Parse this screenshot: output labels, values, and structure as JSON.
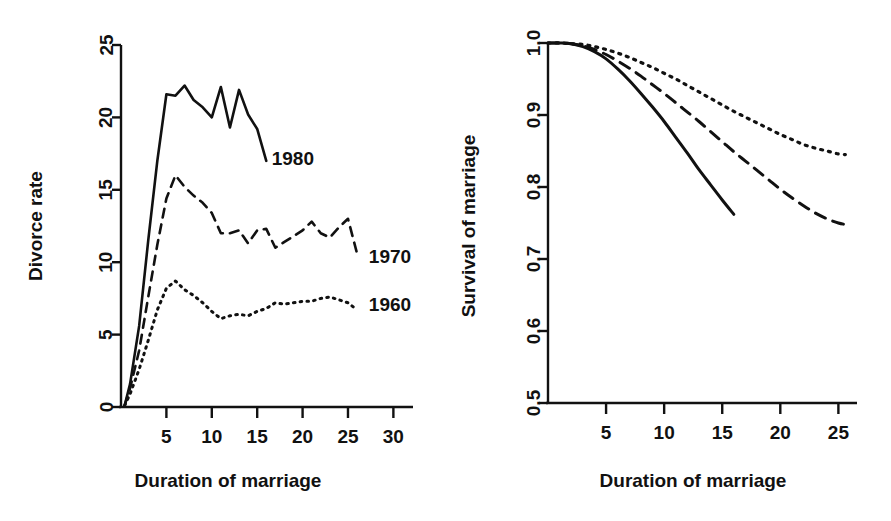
{
  "figure": {
    "background": "#ffffff",
    "ink": "#111111",
    "panels": [
      "divorce-rate",
      "survival-of-marriage"
    ]
  },
  "chart_data": [
    {
      "type": "line",
      "id": "divorce-rate",
      "title": "",
      "xlabel": "Duration of marriage",
      "ylabel": "Divorce rate",
      "xlim": [
        0,
        31.5
      ],
      "ylim": [
        0,
        25
      ],
      "xticks": [
        5,
        10,
        15,
        20,
        25,
        30
      ],
      "xticklabels": [
        "5",
        "10",
        "15",
        "20",
        "25",
        "30"
      ],
      "yticks": [
        0,
        5,
        10,
        15,
        20,
        25
      ],
      "yticklabels": [
        "0",
        "5",
        "10",
        "15",
        "20",
        "25"
      ],
      "grid": false,
      "legend": "inline-end-labels",
      "series": [
        {
          "name": "1980",
          "style": "solid",
          "label_x": 16.6,
          "label_y": 17.2,
          "x": [
            0.4,
            1,
            2,
            3,
            4,
            5,
            6,
            7,
            8,
            9,
            10,
            11,
            12,
            13,
            14,
            15,
            16
          ],
          "y": [
            0.1,
            1.6,
            5.6,
            11.5,
            17.0,
            21.6,
            21.5,
            22.2,
            21.2,
            20.7,
            20.0,
            22.1,
            19.3,
            21.9,
            20.2,
            19.2,
            17.0
          ]
        },
        {
          "name": "1970",
          "style": "dashed",
          "label_x": 27.3,
          "label_y": 10.4,
          "x": [
            0.4,
            1,
            2,
            3,
            4,
            5,
            6,
            7,
            8,
            9,
            10,
            11,
            12,
            13,
            14,
            15,
            16,
            17,
            18,
            19,
            20,
            21,
            22,
            23,
            24,
            25,
            26
          ],
          "y": [
            0.1,
            1.3,
            3.9,
            7.6,
            11.2,
            14.4,
            16.0,
            15.2,
            14.6,
            14.1,
            13.4,
            12.0,
            12.0,
            12.2,
            11.3,
            12.2,
            12.3,
            11.0,
            11.4,
            11.8,
            12.2,
            12.8,
            12.0,
            11.7,
            12.4,
            13.0,
            10.6
          ]
        },
        {
          "name": "1960",
          "style": "dotted",
          "label_x": 27.3,
          "label_y": 7.1,
          "x": [
            0.4,
            1,
            2,
            3,
            4,
            5,
            6,
            7,
            8,
            9,
            10,
            11,
            12,
            13,
            14,
            15,
            16,
            17,
            18,
            19,
            20,
            21,
            22,
            23,
            24,
            25,
            26
          ],
          "y": [
            0.1,
            0.9,
            2.6,
            4.6,
            6.7,
            8.2,
            8.7,
            8.1,
            7.7,
            7.2,
            6.6,
            6.1,
            6.3,
            6.4,
            6.3,
            6.6,
            6.8,
            7.2,
            7.1,
            7.2,
            7.3,
            7.3,
            7.5,
            7.6,
            7.4,
            7.2,
            6.7
          ]
        }
      ]
    },
    {
      "type": "line",
      "id": "survival-of-marriage",
      "title": "",
      "xlabel": "Duration of marriage",
      "ylabel": "Survival of marriage",
      "xlim": [
        0,
        26
      ],
      "ylim": [
        0.5,
        1.0
      ],
      "xticks": [
        5,
        10,
        15,
        20,
        25
      ],
      "xticklabels": [
        "5",
        "10",
        "15",
        "20",
        "25"
      ],
      "yticks": [
        0.5,
        0.6,
        0.7,
        0.8,
        0.9,
        1.0
      ],
      "yticklabels": [
        "0.5",
        "0.6",
        "0.7",
        "0.8",
        "0.9",
        "1.0"
      ],
      "grid": false,
      "legend": "none",
      "series": [
        {
          "name": "1980",
          "style": "solid",
          "x": [
            0,
            1,
            2,
            3,
            4,
            5,
            6,
            7,
            8,
            9,
            10,
            11,
            12,
            13,
            14,
            15,
            16
          ],
          "y": [
            1.0,
            1.0,
            0.999,
            0.995,
            0.988,
            0.978,
            0.964,
            0.948,
            0.93,
            0.911,
            0.891,
            0.869,
            0.847,
            0.824,
            0.803,
            0.782,
            0.762
          ]
        },
        {
          "name": "1970",
          "style": "dashed",
          "x": [
            0,
            1,
            2,
            3,
            4,
            5,
            6,
            7,
            8,
            9,
            10,
            11,
            12,
            13,
            14,
            15,
            16,
            17,
            18,
            19,
            20,
            21,
            22,
            23,
            24,
            25,
            25.6
          ],
          "y": [
            1.0,
            1.0,
            0.999,
            0.996,
            0.991,
            0.984,
            0.975,
            0.965,
            0.954,
            0.942,
            0.93,
            0.917,
            0.904,
            0.891,
            0.877,
            0.863,
            0.849,
            0.836,
            0.823,
            0.81,
            0.797,
            0.785,
            0.774,
            0.764,
            0.756,
            0.75,
            0.748
          ]
        },
        {
          "name": "1960",
          "style": "dotted",
          "x": [
            0,
            1,
            2,
            3,
            4,
            5,
            6,
            7,
            8,
            9,
            10,
            11,
            12,
            13,
            14,
            15,
            16,
            17,
            18,
            19,
            20,
            21,
            22,
            23,
            24,
            25,
            25.6
          ],
          "y": [
            1.0,
            1.0,
            0.999,
            0.998,
            0.995,
            0.991,
            0.986,
            0.98,
            0.973,
            0.966,
            0.958,
            0.95,
            0.941,
            0.932,
            0.923,
            0.914,
            0.905,
            0.897,
            0.889,
            0.881,
            0.873,
            0.866,
            0.859,
            0.854,
            0.85,
            0.846,
            0.845
          ]
        }
      ]
    }
  ]
}
